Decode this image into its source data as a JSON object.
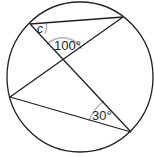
{
  "diagram": {
    "type": "inscribed-angles-circle",
    "circle": {
      "cx": 80,
      "cy": 77,
      "rx": 73,
      "ry": 75,
      "stroke": "#231f20"
    },
    "points": {
      "top_left": [
        30,
        24
      ],
      "top_right": [
        123,
        17
      ],
      "left": [
        10,
        97
      ],
      "bottom_right": [
        131,
        132
      ],
      "intersection": [
        63,
        61
      ]
    },
    "chords": [
      {
        "from": "top_left",
        "to": "top_right"
      },
      {
        "from": "top_left",
        "to": "bottom_right"
      },
      {
        "from": "left",
        "to": "top_right"
      },
      {
        "from": "left",
        "to": "bottom_right"
      }
    ],
    "arc_color": "#b3b3b3",
    "labels": {
      "angle_c": "c",
      "angle_100": "100°",
      "angle_30": "30°"
    }
  }
}
